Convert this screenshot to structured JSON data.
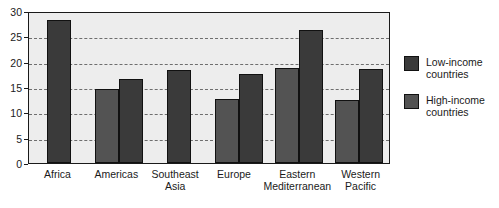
{
  "chart_data": {
    "type": "bar",
    "title": "",
    "subtitle": "",
    "xlabel": "",
    "ylabel": "",
    "ylim": [
      0,
      30
    ],
    "yticks": [
      0,
      5,
      10,
      15,
      20,
      25,
      30
    ],
    "ytick_labels": [
      "0",
      "5",
      "10",
      "15",
      "20",
      "25",
      "30"
    ],
    "grid": true,
    "grid_style": "dashed-horizontal",
    "legend_position": "right",
    "categories": [
      "Africa",
      "Americas",
      "Southeast\nAsia",
      "Europe",
      "Eastern\nMediterranean",
      "Western\nPacific"
    ],
    "series": [
      {
        "name": "High-income countries",
        "color": "#535353",
        "values": [
          null,
          14.7,
          null,
          12.6,
          18.7,
          12.4
        ]
      },
      {
        "name": "Low-income countries",
        "color": "#3a3a3a",
        "values": [
          28.3,
          16.6,
          18.3,
          17.6,
          26.2,
          18.6
        ]
      }
    ],
    "bar_order_in_group": [
      "High-income countries",
      "Low-income countries"
    ]
  },
  "legend": {
    "items": [
      {
        "label": "Low-income\ncountries",
        "color": "#3a3a3a",
        "swatch": "low"
      },
      {
        "label": "High-income\ncountries",
        "color": "#535353",
        "swatch": "high"
      }
    ]
  },
  "colors": {
    "plot_background": "#ededed",
    "axis": "#1a1a1a",
    "gridline": "#6e6e6e",
    "low_income": "#3a3a3a",
    "high_income": "#535353"
  }
}
